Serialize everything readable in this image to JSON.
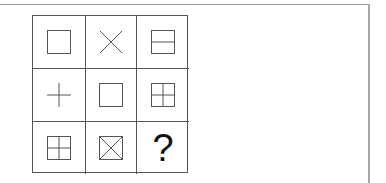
{
  "puzzle": {
    "cells": [
      {
        "row": 1,
        "col": 1,
        "icon": "square-icon"
      },
      {
        "row": 1,
        "col": 2,
        "icon": "x-cross-icon"
      },
      {
        "row": 1,
        "col": 3,
        "icon": "square-horizontal-line-icon"
      },
      {
        "row": 2,
        "col": 1,
        "icon": "plus-icon"
      },
      {
        "row": 2,
        "col": 2,
        "icon": "square-icon"
      },
      {
        "row": 2,
        "col": 3,
        "icon": "square-plus-icon"
      },
      {
        "row": 3,
        "col": 1,
        "icon": "square-plus-icon"
      },
      {
        "row": 3,
        "col": 2,
        "icon": "square-x-icon"
      },
      {
        "row": 3,
        "col": 3,
        "icon": "question-mark",
        "text": "?"
      }
    ],
    "line_color": "#555555"
  }
}
